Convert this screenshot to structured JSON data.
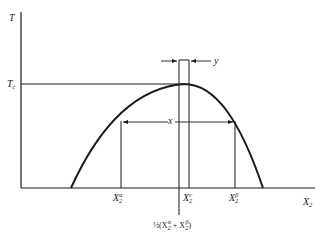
{
  "diagram": {
    "type": "phase-diagram-coexistence-curve",
    "axes": {
      "y_label": "T",
      "x_label_main": "X",
      "x_label_sub": "2"
    },
    "reference_line": {
      "label_main": "T",
      "label_sub": "c"
    },
    "markers": {
      "alpha": {
        "main": "X",
        "sub": "2",
        "sup": "α"
      },
      "critical": {
        "main": "X",
        "sub": "2",
        "sup": "c"
      },
      "beta": {
        "main": "X",
        "sub": "2",
        "sup": "β"
      }
    },
    "dimensions": {
      "x_width_label": "x",
      "y_width_label": "y"
    },
    "midpoint_label": {
      "prefix": "½(X",
      "a_sub": "2",
      "a_sup": "α",
      "plus": " + X",
      "b_sub": "2",
      "b_sup": "β",
      "suffix": ")"
    },
    "colors": {
      "line": "#1a1a1a",
      "background": "#ffffff"
    }
  }
}
